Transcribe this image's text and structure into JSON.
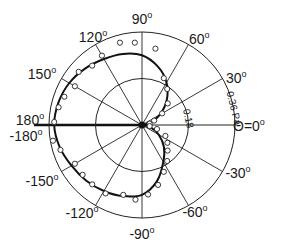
{
  "chart_data": {
    "type": "polar",
    "title": "",
    "angle_unit": "degrees",
    "angle_labels": [
      {
        "angle": 0,
        "text": "Θ=0°"
      },
      {
        "angle": 30,
        "text": "30°"
      },
      {
        "angle": 60,
        "text": "60°"
      },
      {
        "angle": 90,
        "text": "90°"
      },
      {
        "angle": 120,
        "text": "120°"
      },
      {
        "angle": 150,
        "text": "150°"
      },
      {
        "angle": 180,
        "text": "180°"
      },
      {
        "angle": -180,
        "text": "-180°"
      },
      {
        "angle": -150,
        "text": "-150°"
      },
      {
        "angle": -120,
        "text": "-120°"
      },
      {
        "angle": -90,
        "text": "-90°"
      },
      {
        "angle": -60,
        "text": "-60°"
      },
      {
        "angle": -30,
        "text": "-30°"
      }
    ],
    "radial_rings": [
      {
        "value": 0.18,
        "label": "0.18"
      },
      {
        "value": 0.36,
        "label": "0.36 Pa"
      }
    ],
    "radial_unit": "Pa",
    "rmax": 0.36,
    "series": [
      {
        "name": "theory",
        "style": "line",
        "points": [
          [
            0,
            0.0
          ],
          [
            15,
            0.035
          ],
          [
            30,
            0.08
          ],
          [
            45,
            0.135
          ],
          [
            60,
            0.19
          ],
          [
            75,
            0.235
          ],
          [
            90,
            0.27
          ],
          [
            105,
            0.285
          ],
          [
            120,
            0.295
          ],
          [
            135,
            0.31
          ],
          [
            150,
            0.325
          ],
          [
            165,
            0.335
          ],
          [
            180,
            0.34
          ],
          [
            -165,
            0.33
          ],
          [
            -150,
            0.315
          ],
          [
            -135,
            0.305
          ],
          [
            -120,
            0.295
          ],
          [
            -105,
            0.285
          ],
          [
            -90,
            0.27
          ],
          [
            -75,
            0.225
          ],
          [
            -60,
            0.165
          ],
          [
            -45,
            0.12
          ],
          [
            -30,
            0.075
          ],
          [
            -15,
            0.035
          ],
          [
            0,
            0.0
          ]
        ]
      },
      {
        "name": "measured",
        "style": "open-circle",
        "points": [
          [
            10,
            0.03
          ],
          [
            20,
            0.05
          ],
          [
            30,
            0.09
          ],
          [
            40,
            0.13
          ],
          [
            55,
            0.17
          ],
          [
            65,
            0.2
          ],
          [
            80,
            0.3
          ],
          [
            95,
            0.32
          ],
          [
            105,
            0.33
          ],
          [
            120,
            0.31
          ],
          [
            130,
            0.3
          ],
          [
            140,
            0.32
          ],
          [
            150,
            0.3
          ],
          [
            160,
            0.32
          ],
          [
            168,
            0.33
          ],
          [
            178,
            0.34
          ],
          [
            -170,
            0.35
          ],
          [
            -163,
            0.33
          ],
          [
            -150,
            0.3
          ],
          [
            -140,
            0.3
          ],
          [
            -130,
            0.3
          ],
          [
            -118,
            0.3
          ],
          [
            -105,
            0.28
          ],
          [
            -95,
            0.29
          ],
          [
            -85,
            0.27
          ],
          [
            -75,
            0.24
          ],
          [
            -65,
            0.2
          ],
          [
            -55,
            0.17
          ],
          [
            -45,
            0.14
          ],
          [
            -35,
            0.12
          ],
          [
            -25,
            0.1
          ],
          [
            -15,
            0.06
          ],
          [
            -8,
            0.03
          ]
        ]
      }
    ],
    "grid": true,
    "legend": null
  }
}
